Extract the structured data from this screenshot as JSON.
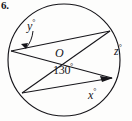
{
  "problem": {
    "number": "6."
  },
  "figure": {
    "type": "circle-geometry-diagram",
    "center_label": "O",
    "labels": [
      {
        "id": "y",
        "text": "y",
        "degree": true,
        "display": "y°"
      },
      {
        "id": "z",
        "text": "z",
        "degree": true,
        "display": "z°"
      },
      {
        "id": "x",
        "text": "x",
        "degree": true,
        "display": "x°"
      },
      {
        "id": "angle",
        "text": "130",
        "degree": true,
        "display": "130°"
      }
    ],
    "label_y": "y",
    "label_z": "z",
    "label_x": "x",
    "label_angle": "130",
    "degree_symbol": "°",
    "colors": {
      "ink": "#16151a",
      "paper": "#fdfdfc"
    },
    "geometry": {
      "circle": {
        "cx": 64,
        "cy": 60,
        "r": 56
      },
      "points": {
        "A": {
          "x": 10,
          "y": 50,
          "note": "left point where y-angle arrow lands"
        },
        "B": {
          "x": 110,
          "y": 31,
          "note": "upper-right convergence point"
        },
        "C": {
          "x": 22,
          "y": 93,
          "note": "lower-left point"
        },
        "D": {
          "x": 112,
          "y": 78,
          "note": "right point where x-angle arrow lands"
        },
        "E": {
          "x": 64,
          "y": 80,
          "note": "lower intersection near center"
        },
        "O": {
          "x": 62,
          "y": 57,
          "note": "center"
        }
      },
      "chords": [
        {
          "from": "A",
          "to": "B"
        },
        {
          "from": "B",
          "to": "C"
        },
        {
          "from": "C",
          "to": "D"
        },
        {
          "from": "A",
          "to": "D"
        }
      ]
    }
  }
}
